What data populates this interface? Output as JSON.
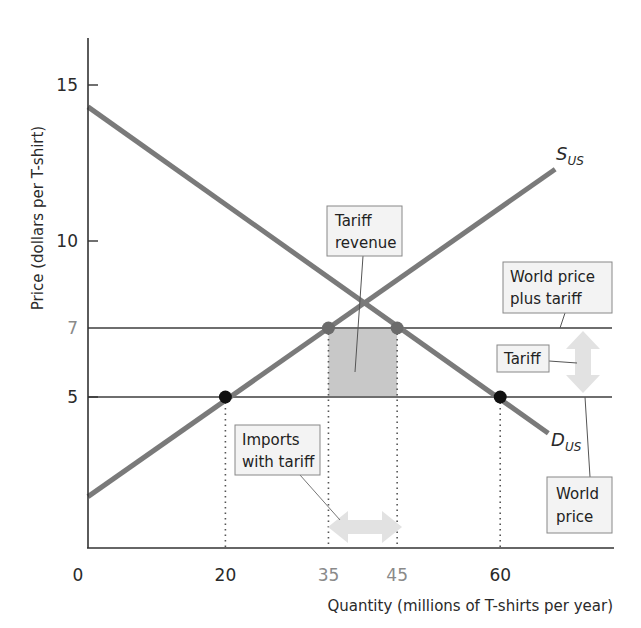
{
  "chart_data": {
    "type": "line",
    "title": "",
    "xlabel": "Quantity (millions of T-shirts per year)",
    "ylabel": "Price (dollars per T-shirt)",
    "xlim": [
      0,
      75
    ],
    "ylim": [
      0,
      16.5
    ],
    "grid": false,
    "x_ticks": [
      {
        "value": 0,
        "label": "0",
        "muted": false
      },
      {
        "value": 20,
        "label": "20",
        "muted": false
      },
      {
        "value": 35,
        "label": "35",
        "muted": true
      },
      {
        "value": 45,
        "label": "45",
        "muted": true
      },
      {
        "value": 60,
        "label": "60",
        "muted": false
      }
    ],
    "y_ticks": [
      {
        "value": 5,
        "label": "5",
        "muted": false
      },
      {
        "value": 7,
        "label": "7",
        "muted": true
      },
      {
        "value": 10,
        "label": "10",
        "muted": false
      },
      {
        "value": 15,
        "label": "15",
        "muted": false
      }
    ],
    "series": [
      {
        "name": "S_US",
        "label_main": "S",
        "label_sub": "US",
        "kind": "supply",
        "points": [
          [
            0,
            1.7
          ],
          [
            68,
            12.3
          ]
        ],
        "color": "#7a7a7a"
      },
      {
        "name": "D_US",
        "label_main": "D",
        "label_sub": "US",
        "kind": "demand",
        "points": [
          [
            0,
            14.3
          ],
          [
            67,
            3.8
          ]
        ],
        "color": "#7a7a7a"
      }
    ],
    "horizontal_lines": [
      {
        "name": "World price plus tariff",
        "price": 7,
        "color": "#6e6e6e"
      },
      {
        "name": "World price",
        "price": 5,
        "color": "#6e6e6e"
      }
    ],
    "points": [
      {
        "name": "US production at world price",
        "x": 20,
        "y": 5,
        "color": "#111111"
      },
      {
        "name": "US consumption at world price",
        "x": 60,
        "y": 5,
        "color": "#111111"
      },
      {
        "name": "US production with tariff",
        "x": 35,
        "y": 7,
        "color": "#6b6b6b"
      },
      {
        "name": "US consumption with tariff",
        "x": 45,
        "y": 7,
        "color": "#6b6b6b"
      }
    ],
    "shaded_region": {
      "name": "Tariff revenue",
      "x": [
        35,
        45
      ],
      "y": [
        5,
        7
      ],
      "color": "#c8c8c8"
    },
    "dotted_drops": [
      20,
      35,
      45,
      60
    ],
    "annotations": [
      {
        "id": "tariff_revenue",
        "lines": [
          "Tariff",
          "revenue"
        ]
      },
      {
        "id": "world_price_plus_tariff",
        "lines": [
          "World price",
          "plus tariff"
        ]
      },
      {
        "id": "tariff",
        "lines": [
          "Tariff"
        ]
      },
      {
        "id": "world_price",
        "lines": [
          "World",
          "price"
        ]
      },
      {
        "id": "imports_with_tariff",
        "lines": [
          "Imports",
          "with tariff"
        ]
      }
    ]
  },
  "labels": {
    "x_axis_title": "Quantity (millions of T-shirts per year)",
    "y_axis_title": "Price (dollars per T-shirt)",
    "supply_main": "S",
    "supply_sub": "US",
    "demand_main": "D",
    "demand_sub": "US",
    "tariff_revenue_1": "Tariff",
    "tariff_revenue_2": "revenue",
    "wpt_1": "World price",
    "wpt_2": "plus tariff",
    "tariff": "Tariff",
    "world_price_1": "World",
    "world_price_2": "price",
    "imports_1": "Imports",
    "imports_2": "with tariff"
  }
}
